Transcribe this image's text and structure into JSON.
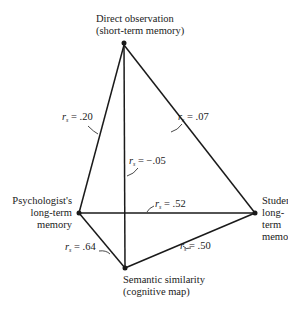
{
  "nodes": {
    "top": {
      "line1": "Direct observation",
      "line2": "(short-term memory)"
    },
    "left": {
      "line1": "Psychologist's",
      "line2": "long-term",
      "line3": "memory"
    },
    "right": {
      "line1": "Students'",
      "line2": "long-term",
      "line3": "memory"
    },
    "bottom": {
      "line1": "Semantic similarity",
      "line2": "(cognitive map)"
    }
  },
  "correlations": {
    "symbol": "r",
    "subscript": "s",
    "top_left": " = .20",
    "top_right": " = .07",
    "top_bottom": " = −.05",
    "left_right": " = .52",
    "left_bottom": " = .64",
    "right_bottom": " = .50"
  },
  "colors": {
    "line": "#1a1a1a",
    "text": "#1a1a1a"
  }
}
